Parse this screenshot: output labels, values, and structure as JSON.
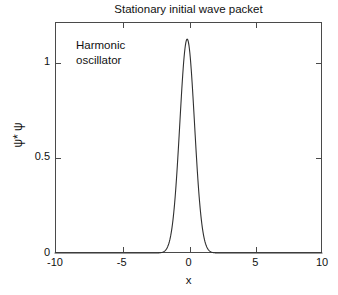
{
  "chart_data": {
    "type": "line",
    "title": "Stationary initial wave packet",
    "xlabel": "x",
    "ylabel": "ψ* ψ",
    "annotation": "Harmonic\noscillator",
    "xlim": [
      -10,
      10
    ],
    "ylim": [
      0,
      1.08
    ],
    "xticks": [
      -10,
      -5,
      0,
      5,
      10
    ],
    "xticklabels": [
      "-10",
      "-5",
      "0",
      "5",
      "10"
    ],
    "yticks": [
      0,
      0.5,
      1
    ],
    "yticklabels": [
      "0",
      "0.5",
      "1"
    ],
    "grid": false,
    "legend": null,
    "line_color": "#303030",
    "frame_color": "#4a4a4a",
    "background": "#ffffff",
    "series": [
      {
        "name": "psi-star-psi",
        "description": "Gaussian probability density of initial wave packet, peak amplitude 1 centered near x = -0.1 with width sigma = 0.55",
        "peak_x": -0.1,
        "peak_y": 1.0,
        "sigma": 0.55,
        "x": [
          -10.0,
          -9.0,
          -8.0,
          -7.0,
          -6.0,
          -5.0,
          -4.5,
          -4.0,
          -3.5,
          -3.25,
          -3.0,
          -2.75,
          -2.5,
          -2.25,
          -2.0,
          -1.75,
          -1.5,
          -1.25,
          -1.0,
          -0.9,
          -0.8,
          -0.7,
          -0.6,
          -0.5,
          -0.4,
          -0.3,
          -0.2,
          -0.1,
          0.0,
          0.1,
          0.2,
          0.3,
          0.4,
          0.5,
          0.6,
          0.7,
          0.8,
          0.9,
          1.0,
          1.25,
          1.5,
          1.75,
          2.0,
          2.25,
          2.5,
          2.75,
          3.0,
          3.25,
          3.5,
          4.0,
          4.5,
          5.0,
          6.0,
          7.0,
          8.0,
          9.0,
          10.0
        ],
        "y": [
          0.0,
          0.0,
          0.0,
          0.0,
          0.0,
          0.0,
          0.0,
          0.0,
          0.001,
          0.002,
          0.004,
          0.009,
          0.019,
          0.038,
          0.07,
          0.121,
          0.196,
          0.296,
          0.416,
          0.467,
          0.519,
          0.57,
          0.62,
          0.687,
          0.753,
          0.824,
          0.893,
          0.967,
          0.985,
          0.967,
          0.919,
          0.853,
          0.773,
          0.686,
          0.595,
          0.506,
          0.421,
          0.343,
          0.274,
          0.147,
          0.071,
          0.03,
          0.011,
          0.004,
          0.001,
          0.0,
          0.0,
          0.0,
          0.0,
          0.0,
          0.0,
          0.0,
          0.0,
          0.0,
          0.0,
          0.0,
          0.0
        ]
      }
    ]
  }
}
